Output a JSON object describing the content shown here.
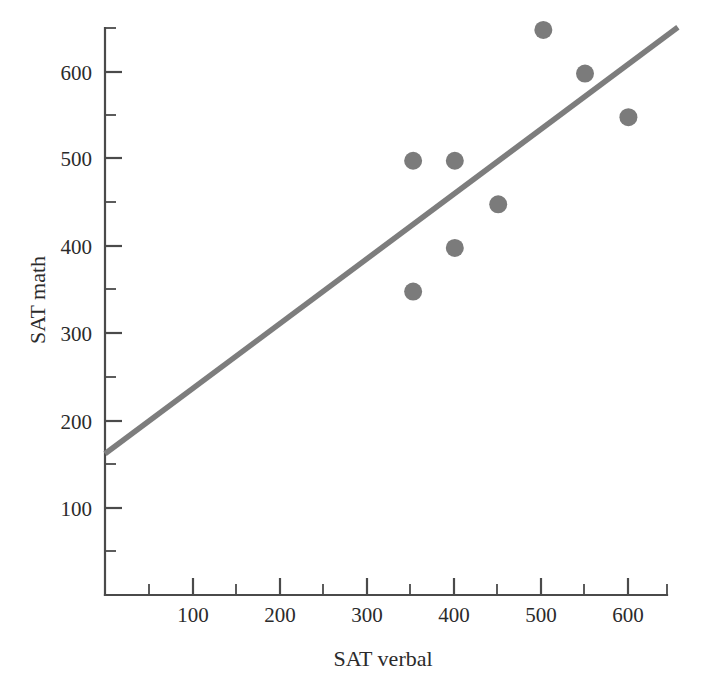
{
  "chart_data": {
    "type": "scatter",
    "title": "",
    "xlabel": "SAT verbal",
    "ylabel": "SAT math",
    "xlim": [
      0,
      660
    ],
    "ylim": [
      0,
      683
    ],
    "grid": false,
    "legend": "none",
    "x_ticks": [
      100,
      200,
      300,
      400,
      500,
      600
    ],
    "x_tick_labels": [
      "100",
      "200",
      "300",
      "400",
      "500",
      "600"
    ],
    "x_minor_ticks": [
      50,
      150,
      250,
      350,
      450,
      550,
      650
    ],
    "y_ticks": [
      100,
      200,
      300,
      400,
      500,
      600
    ],
    "y_tick_labels": [
      "100",
      "200",
      "300",
      "400",
      "500",
      "600"
    ],
    "y_minor_ticks": [
      50,
      150,
      250,
      350,
      450,
      550,
      650
    ],
    "points": [
      {
        "x": 355,
        "y": 498
      },
      {
        "x": 355,
        "y": 348
      },
      {
        "x": 403,
        "y": 498
      },
      {
        "x": 403,
        "y": 398
      },
      {
        "x": 453,
        "y": 448
      },
      {
        "x": 505,
        "y": 648
      },
      {
        "x": 553,
        "y": 598
      },
      {
        "x": 603,
        "y": 548
      }
    ],
    "series": [
      {
        "name": "observations",
        "type": "scatter",
        "marker": "circle",
        "color": "#7b7b7b",
        "values": [
          498,
          348,
          498,
          398,
          448,
          648,
          598,
          548
        ]
      },
      {
        "name": "regression-line",
        "type": "line",
        "color": "#7d7d7d",
        "endpoints": [
          {
            "x": 0,
            "y": 162
          },
          {
            "x": 660,
            "y": 651
          }
        ]
      }
    ],
    "trend_line": {
      "x_start": 0,
      "y_start": 162,
      "x_end": 660,
      "y_end": 651,
      "color": "#7d7d7d"
    }
  },
  "axes": {
    "x_title": "SAT verbal",
    "y_title": "SAT math"
  },
  "colors": {
    "marker": "#7b7b7b",
    "line": "#7d7d7d",
    "axis": "#4a4a4a",
    "text": "#2b2b2b",
    "background": "#ffffff"
  }
}
